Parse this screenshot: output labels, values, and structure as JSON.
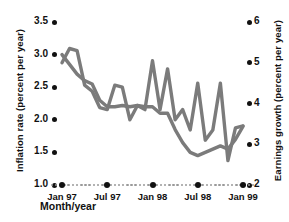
{
  "chart_data": {
    "type": "line",
    "title": "",
    "xlabel": "Month/year",
    "grid": false,
    "legend_position": "none",
    "x_tick_labels": [
      "Jan 97",
      "Jul 97",
      "Jan 98",
      "Jul 98",
      "Jan 99"
    ],
    "x_major_indices": [
      0,
      6,
      12,
      18,
      24
    ],
    "x_minor_count": 25,
    "axes": [
      {
        "side": "left",
        "label": "Inflation rate (percent per year)",
        "ticks": [
          "3.5",
          "3.0",
          "2.5",
          "2.0",
          "1.5",
          "1.0"
        ],
        "tick_values": [
          3.5,
          3.0,
          2.5,
          2.0,
          1.5,
          1.0
        ],
        "range": [
          1.0,
          3.5
        ]
      },
      {
        "side": "right",
        "label": "Earnings growth (percent per year)",
        "ticks": [
          "6",
          "5",
          "4",
          "3",
          "2"
        ],
        "tick_values": [
          6,
          5,
          4,
          3,
          2
        ],
        "range": [
          2,
          6
        ]
      }
    ],
    "series": [
      {
        "name": "Inflation rate",
        "axis": "left",
        "color": "#7b7b7b",
        "x": [
          "Jan 97",
          "Feb 97",
          "Mar 97",
          "Apr 97",
          "May 97",
          "Jun 97",
          "Jul 97",
          "Aug 97",
          "Sep 97",
          "Oct 97",
          "Nov 97",
          "Dec 97",
          "Jan 98",
          "Feb 98",
          "Mar 98",
          "Apr 98",
          "May 98",
          "Jun 98",
          "Jul 98",
          "Aug 98",
          "Sep 98",
          "Oct 98",
          "Nov 98",
          "Dec 98",
          "Jan 99"
        ],
        "values": [
          3.0,
          2.85,
          2.7,
          2.6,
          2.55,
          2.3,
          2.2,
          2.2,
          2.22,
          2.2,
          2.22,
          2.2,
          2.2,
          2.1,
          2.1,
          1.85,
          1.65,
          1.5,
          1.45,
          1.5,
          1.55,
          1.6,
          1.55,
          1.7,
          1.9
        ]
      },
      {
        "name": "Earnings growth",
        "axis": "right",
        "color": "#7b7b7b",
        "x": [
          "Jan 97",
          "Feb 97",
          "Mar 97",
          "Apr 97",
          "May 97",
          "Jun 97",
          "Jul 97",
          "Aug 97",
          "Sep 97",
          "Oct 97",
          "Nov 97",
          "Dec 97",
          "Jan 98",
          "Feb 98",
          "Mar 98",
          "Apr 98",
          "May 98",
          "Jun 98",
          "Jul 98",
          "Aug 98",
          "Sep 98",
          "Oct 98",
          "Nov 98",
          "Dec 98",
          "Jan 99"
        ],
        "values": [
          5.0,
          5.35,
          5.3,
          4.45,
          4.3,
          3.9,
          3.85,
          4.45,
          4.4,
          3.6,
          3.95,
          3.85,
          5.05,
          3.85,
          4.85,
          3.6,
          3.85,
          3.35,
          4.5,
          3.1,
          3.35,
          4.5,
          2.6,
          3.4,
          3.45
        ]
      }
    ]
  }
}
